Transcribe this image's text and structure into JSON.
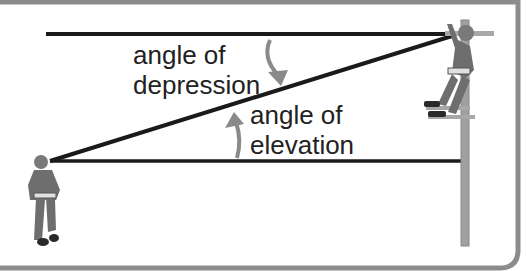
{
  "diagram": {
    "type": "angle-of-elevation-and-depression",
    "labels": {
      "depression_line1": "angle of",
      "depression_line2": "depression",
      "elevation_line1": "angle of",
      "elevation_line2": "elevation"
    },
    "figures": {
      "observer_ground": "person standing on ground looking up",
      "observer_pole": "lineman climbing utility pole looking down"
    },
    "colors": {
      "line": "#1a1a1a",
      "arrow": "#8a8a8a",
      "border": "#8c8c8c",
      "pole": "#a0a0a0",
      "figure": "#6e6e6e"
    }
  }
}
